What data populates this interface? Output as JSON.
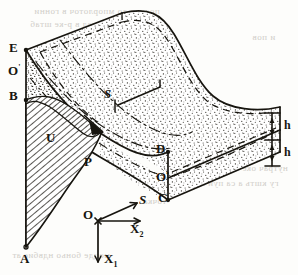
{
  "figure": {
    "kind": "engineering-diagram",
    "background_color": "#fdfdfb",
    "ink_color": "#17150f"
  },
  "labels": {
    "corner_e": "E",
    "corner_o_prime": "O",
    "corner_o_prime_mark": "'",
    "corner_b": "B",
    "corner_a": "A",
    "corner_p": "P",
    "corner_u": "U",
    "corner_d": "D",
    "corner_o_star": "O",
    "corner_o_star_mark": "•",
    "corner_c": "C",
    "surface_s": "S",
    "thickness_top": "h",
    "thickness_bottom": "h"
  },
  "axes": {
    "origin": "O",
    "axis_s": "S",
    "axis_x2_base": "X",
    "axis_x2_sub": "2",
    "axis_x1_base": "X",
    "axis_x1_sub": "1"
  },
  "bleed_text": {
    "line1": "подиев до мпорлоточ в гонни",
    "line2": "Эпер. предел в р-ке штаб",
    "line3": "и пов",
    "line4": "точка",
    "line5": "пвдо Н.В. коебра вводи",
    "line6": "нутрач оке бын пров мощ",
    "line7": "гу кшть а са пуи лопидев",
    "line8": "моцде боньо ндвбис ат"
  },
  "colors": {
    "ink": "#17150f",
    "paper": "#fdfdfb",
    "stipple": "#2a2720",
    "hatch": "#1a1812",
    "bleed": "#c9c6bf"
  }
}
